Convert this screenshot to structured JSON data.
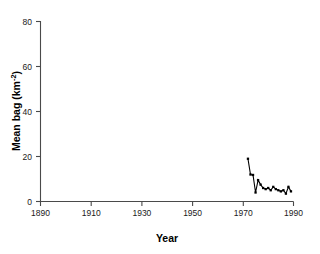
{
  "chart_data": {
    "type": "line",
    "title": "",
    "xlabel": "Year",
    "ylabel": "Mean bag (km-2)",
    "ylabel_display": "Mean bag (km",
    "ylabel_exponent": "-2",
    "ylabel_suffix": ")",
    "xlim": [
      1890,
      1990
    ],
    "ylim": [
      0,
      80
    ],
    "xticks": [
      1890,
      1910,
      1930,
      1950,
      1970,
      1990
    ],
    "xticklabels": [
      "1890",
      "1910",
      "1930",
      "1950",
      "1970",
      "1990"
    ],
    "yticks": [
      0,
      20,
      40,
      60,
      80
    ],
    "yticklabels": [
      "0",
      "20",
      "40",
      "60",
      "80"
    ],
    "grid": false,
    "legend": false,
    "legend_position": "none",
    "marker": "square",
    "line_color": "#000000",
    "marker_color": "#000000",
    "axis_color": "#4a4a4a",
    "background_color": "#ffffff",
    "series": [
      {
        "name": "Mean bag",
        "x": [
          1972,
          1973,
          1974,
          1975,
          1976,
          1977,
          1978,
          1979,
          1980,
          1981,
          1982,
          1983,
          1984,
          1985,
          1986,
          1987,
          1988,
          1989
        ],
        "values": [
          19.0,
          12.0,
          11.8,
          4.0,
          9.5,
          7.5,
          6.0,
          5.5,
          6.0,
          5.0,
          6.5,
          5.5,
          5.0,
          4.5,
          5.0,
          3.5,
          6.5,
          4.5
        ]
      }
    ]
  }
}
